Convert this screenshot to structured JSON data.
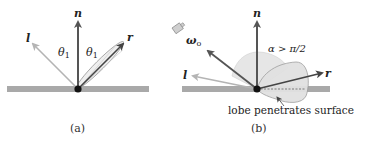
{
  "panels": [
    {
      "id": "a",
      "caption": "(a)",
      "labels": {
        "normal": "n",
        "light": "l",
        "reflect": "r",
        "theta_left": "θ",
        "theta_left_sub": "1",
        "theta_right": "θ",
        "theta_right_sub": "1"
      }
    },
    {
      "id": "b",
      "caption": "(b)",
      "labels": {
        "normal": "n",
        "light": "l",
        "reflect": "r",
        "view": "ω",
        "view_sub": "o",
        "angle_condition": "α > π/2",
        "annotation": "lobe penetrates surface"
      },
      "icons": [
        "camera-icon"
      ]
    }
  ],
  "colors": {
    "surface": "#a9a9a9",
    "normal_arrow": "#555555",
    "light_arrow": "#b4b4b4",
    "reflect_arrow": "#444444",
    "view_arrow": "#555555",
    "lobe_fill": "#e3e3e3",
    "lobe_stroke": "#9a9a9a",
    "origin_dot": "#111111"
  }
}
